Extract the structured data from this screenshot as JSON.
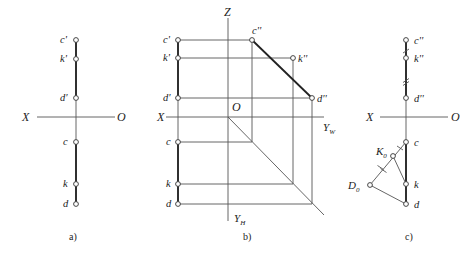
{
  "figure": {
    "panels": [
      {
        "id": "a",
        "caption": "a)",
        "caption_pos": [
          69,
          240
        ],
        "axis": {
          "x_label": "X",
          "o_label": "O",
          "x1": 37,
          "x2": 115,
          "y": 117,
          "x_label_pos": [
            22,
            121
          ],
          "o_label_pos": [
            117,
            121
          ]
        },
        "vline": {
          "x": 76,
          "y1": 40,
          "y2": 204
        },
        "thick_segments": [
          [
            76,
            40,
            76,
            98
          ],
          [
            76,
            142,
            76,
            204
          ]
        ],
        "points": [
          {
            "label": "c'",
            "x": 76,
            "y": 40,
            "lx": 60,
            "ly": 43
          },
          {
            "label": "k'",
            "x": 76,
            "y": 59,
            "lx": 60,
            "ly": 62
          },
          {
            "label": "d'",
            "x": 76,
            "y": 98,
            "lx": 60,
            "ly": 101
          },
          {
            "label": "c",
            "x": 76,
            "y": 142,
            "lx": 63,
            "ly": 145
          },
          {
            "label": "k",
            "x": 76,
            "y": 184,
            "lx": 63,
            "ly": 187
          },
          {
            "label": "d",
            "x": 76,
            "y": 204,
            "lx": 63,
            "ly": 207
          }
        ]
      },
      {
        "id": "b",
        "caption": "b)",
        "caption_pos": [
          243,
          240
        ],
        "axes": {
          "x_label": "X",
          "o_label": "O",
          "z_label": "Z",
          "yw_label": "Y",
          "yw_sub": "W",
          "yh_label": "Y",
          "yh_sub": "H",
          "origin": [
            228,
            117
          ],
          "x_axis": [
            166,
            117,
            324,
            117
          ],
          "z_axis": [
            228,
            18,
            228,
            221
          ],
          "diagonal": [
            228,
            117,
            324,
            215
          ]
        },
        "left_line": {
          "x": 178,
          "y1": 40,
          "y2": 204
        },
        "thick_segments": [
          [
            178,
            40,
            178,
            98
          ],
          [
            178,
            142,
            178,
            204
          ],
          [
            252,
            40,
            312,
            98
          ]
        ],
        "projection_lines": [
          [
            178,
            40,
            252,
            40
          ],
          [
            178,
            58,
            293,
            58
          ],
          [
            178,
            98,
            312,
            98
          ],
          [
            252,
            40,
            252,
            142
          ],
          [
            293,
            58,
            293,
            184
          ],
          [
            312,
            98,
            312,
            204
          ],
          [
            178,
            142,
            252,
            142
          ],
          [
            178,
            184,
            293,
            184
          ],
          [
            178,
            204,
            312,
            204
          ]
        ],
        "points": [
          {
            "label": "c'",
            "x": 178,
            "y": 40,
            "lx": 163,
            "ly": 43
          },
          {
            "label": "k'",
            "x": 178,
            "y": 58,
            "lx": 163,
            "ly": 61
          },
          {
            "label": "d'",
            "x": 178,
            "y": 98,
            "lx": 163,
            "ly": 101
          },
          {
            "label": "c",
            "x": 178,
            "y": 142,
            "lx": 166,
            "ly": 145
          },
          {
            "label": "k",
            "x": 178,
            "y": 184,
            "lx": 166,
            "ly": 187
          },
          {
            "label": "d",
            "x": 178,
            "y": 204,
            "lx": 166,
            "ly": 207
          },
          {
            "label": "c''",
            "x": 252,
            "y": 40,
            "lx": 252,
            "ly": 34
          },
          {
            "label": "k''",
            "x": 293,
            "y": 58,
            "lx": 298,
            "ly": 62
          },
          {
            "label": "d''",
            "x": 312,
            "y": 98,
            "lx": 317,
            "ly": 102
          }
        ]
      },
      {
        "id": "c",
        "caption": "c)",
        "caption_pos": [
          405,
          240
        ],
        "axis": {
          "x_label": "X",
          "o_label": "O",
          "x1": 380,
          "x2": 448,
          "y": 117,
          "x_label_pos": [
            366,
            121
          ],
          "o_label_pos": [
            451,
            121
          ]
        },
        "vline": {
          "x": 406,
          "y1": 40,
          "y2": 204
        },
        "thick_segments": [
          [
            406,
            40,
            406,
            98
          ],
          [
            406,
            142,
            406,
            204
          ]
        ],
        "triangle": [
          [
            406,
            142
          ],
          [
            393,
            156
          ],
          [
            370,
            185
          ],
          [
            406,
            204
          ],
          [
            393,
            156
          ],
          [
            406,
            184
          ]
        ],
        "tick_marks": [
          {
            "x": 406,
            "y": 51,
            "count": 1,
            "orient": "v"
          },
          {
            "x": 406,
            "y": 82,
            "count": 2,
            "orient": "v"
          },
          {
            "x": 400,
            "y": 149,
            "count": 1,
            "orient": "d"
          },
          {
            "x": 382,
            "y": 170,
            "count": 2,
            "orient": "d"
          }
        ],
        "points": [
          {
            "label": "c''",
            "x": 406,
            "y": 40,
            "lx": 414,
            "ly": 44
          },
          {
            "label": "k''",
            "x": 406,
            "y": 58,
            "lx": 414,
            "ly": 62
          },
          {
            "label": "d''",
            "x": 406,
            "y": 98,
            "lx": 414,
            "ly": 102
          },
          {
            "label": "c",
            "x": 406,
            "y": 142,
            "lx": 414,
            "ly": 146
          },
          {
            "label": "K",
            "sub": "0",
            "x": 393,
            "y": 156,
            "lx": 376,
            "ly": 155
          },
          {
            "label": "D",
            "sub": "0",
            "x": 370,
            "y": 185,
            "lx": 348,
            "ly": 189
          },
          {
            "label": "k",
            "x": 406,
            "y": 184,
            "lx": 414,
            "ly": 188
          },
          {
            "label": "d",
            "x": 406,
            "y": 204,
            "lx": 414,
            "ly": 208
          }
        ]
      }
    ]
  }
}
